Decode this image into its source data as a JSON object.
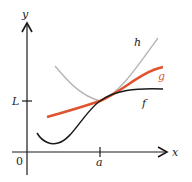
{
  "diagram": {
    "title": "",
    "axes": {
      "x_label": "x",
      "y_label": "y",
      "origin_label": "0",
      "x_tick_label": "a",
      "y_tick_label": "L"
    },
    "curves": [
      {
        "name": "h",
        "label": "h",
        "color": "#b5b5b5",
        "description": "upper curve approaching L at a from above"
      },
      {
        "name": "g",
        "label": "g",
        "color": "#e0532f",
        "description": "middle curve passing through (a, L)"
      },
      {
        "name": "f",
        "label": "f",
        "color": "#1a1a1a",
        "description": "lower curve approaching L at a from below"
      }
    ],
    "colors": {
      "axis": "#1a1a1a",
      "h": "#b5b5b5",
      "g": "#e0532f",
      "f": "#1a1a1a",
      "g_label": "#e0532f"
    }
  }
}
